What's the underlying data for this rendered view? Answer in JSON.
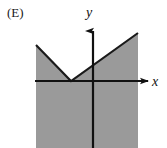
{
  "figure": {
    "panel_label": "(E)",
    "background_color": "#ffffff",
    "width": 167,
    "height": 148
  },
  "axes": {
    "x_label": "x",
    "y_label": "y",
    "axis_color": "#111111",
    "x_axis_y_px": 81,
    "y_axis_x_px": 93,
    "x_axis_start_px": 35,
    "x_axis_end_px": 150,
    "y_axis_top_px": 28,
    "y_axis_bottom_px": 148
  },
  "region": {
    "name": "shaded-region",
    "fill_color": "#9a9a9a",
    "boundary_color": "#1a1a1a",
    "description": "Region below a V-shaped boundary, shaded gray",
    "left_px": 36,
    "right_px": 138,
    "bottom_px": 148
  },
  "chart_data": {
    "type": "line",
    "title": "(E)",
    "xlabel": "x",
    "ylabel": "y",
    "grid": false,
    "legend": null,
    "xlim": [
      -2.5,
      3.0
    ],
    "ylim": [
      -3.0,
      1.6
    ],
    "annotations": [
      "Shaded region is the set of points on or below the V-shaped graph",
      "V-vertex sits on the x-axis to the left of the origin"
    ],
    "series": [
      {
        "name": "v-boundary-left-arm",
        "x": [
          -2.45,
          -1.06
        ],
        "y": [
          1.06,
          0.0
        ]
      },
      {
        "name": "v-boundary-right-arm",
        "x": [
          -1.06,
          1.35
        ],
        "y": [
          0.0,
          1.42
        ]
      }
    ],
    "shaded_polygon": {
      "x": [
        -2.45,
        -1.06,
        1.35,
        1.35,
        -2.45
      ],
      "y": [
        1.06,
        0.0,
        1.42,
        -2.6,
        -2.6
      ]
    },
    "pixel_geometry": {
      "v_left_end": [
        36,
        45
      ],
      "v_vertex": [
        71,
        81
      ],
      "v_right_end": [
        138,
        33
      ],
      "polygon_px": [
        [
          36,
          45
        ],
        [
          71,
          81
        ],
        [
          138,
          33
        ],
        [
          138,
          148
        ],
        [
          36,
          148
        ]
      ]
    }
  }
}
